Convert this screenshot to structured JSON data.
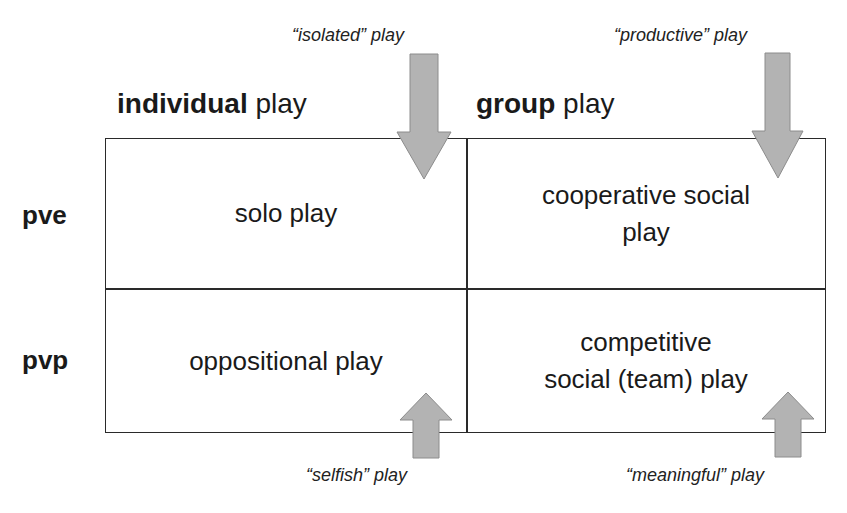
{
  "columns": [
    {
      "bold": "individual",
      "rest": " play"
    },
    {
      "bold": "group",
      "rest": " play"
    }
  ],
  "rows": [
    {
      "label": "pve"
    },
    {
      "label": "pvp"
    }
  ],
  "cells": {
    "pve_individual": "solo play",
    "pve_group_line1": "cooperative social",
    "pve_group_line2": "play",
    "pvp_individual": "oppositional play",
    "pvp_group_line1": "competitive",
    "pvp_group_line2": "social (team) play"
  },
  "annotations": {
    "isolated": "“isolated” play",
    "productive": "“productive” play",
    "selfish": "“selfish” play",
    "meaningful": "“meaningful” play"
  },
  "colors": {
    "arrow_fill": "#b3b3b3",
    "arrow_stroke": "#8c8c8c",
    "line": "#2a2a2a"
  }
}
